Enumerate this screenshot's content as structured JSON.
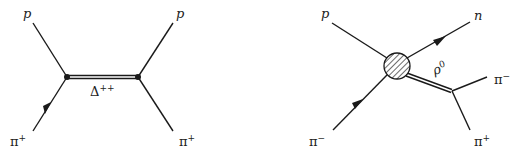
{
  "diagrams": [
    {
      "id": "s-channel",
      "description": "pi+ p scattering via Delta++ resonance",
      "particles": {
        "in_top": {
          "symbol": "p",
          "sup": ""
        },
        "in_bottom": {
          "symbol": "π",
          "sup": "+"
        },
        "out_top": {
          "symbol": "p",
          "sup": ""
        },
        "out_bottom": {
          "symbol": "π",
          "sup": "+"
        },
        "propagator": {
          "symbol": "Δ",
          "sup": "++"
        }
      }
    },
    {
      "id": "rho-production",
      "description": "pi- p -> n rho0, rho0 -> pi- pi+",
      "particles": {
        "in_top": {
          "symbol": "p",
          "sup": ""
        },
        "in_bottom": {
          "symbol": "π",
          "sup": "−"
        },
        "out_top": {
          "symbol": "n",
          "sup": ""
        },
        "resonance": {
          "symbol": "ρ",
          "sup": "0"
        },
        "decay_top": {
          "symbol": "π",
          "sup": "−"
        },
        "decay_bottom": {
          "symbol": "π",
          "sup": "+"
        }
      }
    }
  ],
  "colors": {
    "ink": "#1a1a1a",
    "background": "#ffffff"
  }
}
